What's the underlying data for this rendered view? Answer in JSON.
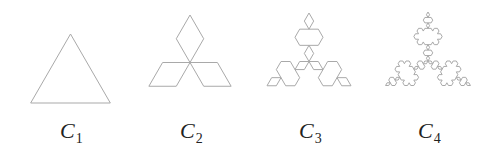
{
  "figure": {
    "stroke_color": "#a9a9a9",
    "stroke_width": 1,
    "curves": [
      {
        "label_main": "C",
        "label_sub": "1",
        "iterations": 0,
        "center": [
          70.5,
          80
        ],
        "radius": 46,
        "label_x": 60
      },
      {
        "label_main": "C",
        "label_sub": "2",
        "iterations": 1,
        "center": [
          190,
          62.5
        ],
        "radius": 47.5,
        "label_x": 180
      },
      {
        "label_main": "C",
        "label_sub": "3",
        "iterations": 2,
        "center": [
          309,
          61.5
        ],
        "radius": 48.5,
        "label_x": 299
      },
      {
        "label_main": "C",
        "label_sub": "4",
        "iterations": 3,
        "center": [
          428,
          61
        ],
        "radius": 49,
        "label_x": 418
      }
    ],
    "label_y": 118
  }
}
